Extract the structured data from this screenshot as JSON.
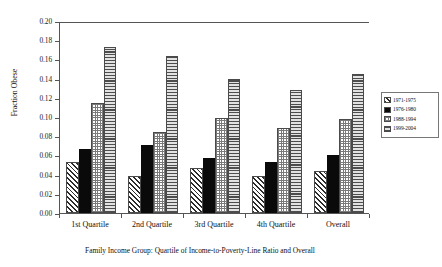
{
  "chart_data": {
    "type": "bar",
    "title": "",
    "xlabel": "Family Income Group: Quartile of Income-to-Poverty-Line Ratio and Overall",
    "ylabel": "Fraction Obese",
    "ylim": [
      0.0,
      0.2
    ],
    "ytick_step": 0.02,
    "yticks": [
      "0.20",
      "0.18",
      "0.16",
      "0.14",
      "0.12",
      "0.10",
      "0.08",
      "0.06",
      "0.04",
      "0.02",
      "0.00"
    ],
    "grid": false,
    "legend_position": "right",
    "categories": [
      "1st Quartile",
      "2nd Quartile",
      "3rd Quartile",
      "4th Quartile",
      "Overall"
    ],
    "series": [
      {
        "name": "1971-1975",
        "pattern": "diagonal-hatch",
        "values": [
          0.053,
          0.039,
          0.047,
          0.039,
          0.044
        ]
      },
      {
        "name": "1976-1980",
        "pattern": "solid-black",
        "values": [
          0.067,
          0.071,
          0.057,
          0.053,
          0.06
        ]
      },
      {
        "name": "1988-1994",
        "pattern": "fine-dot",
        "values": [
          0.115,
          0.084,
          0.099,
          0.089,
          0.098
        ]
      },
      {
        "name": "1999-2004",
        "pattern": "horizontal-lines",
        "values": [
          0.173,
          0.164,
          0.14,
          0.128,
          0.145
        ]
      }
    ]
  }
}
